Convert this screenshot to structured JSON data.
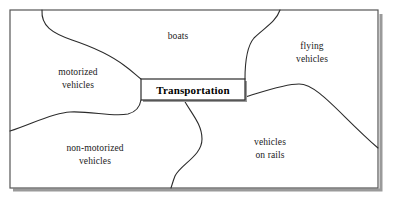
{
  "diagram": {
    "type": "concept-map",
    "center": {
      "label": "Transportation"
    },
    "regions": [
      {
        "id": "motorized-vehicles",
        "label": "motorized\nvehicles",
        "x": 78,
        "y": 78
      },
      {
        "id": "boats",
        "label": "boats",
        "x": 178,
        "y": 36
      },
      {
        "id": "flying-vehicles",
        "label": "flying\nvehicles",
        "x": 312,
        "y": 52
      },
      {
        "id": "non-motorized-vehicles",
        "label": "non-motorized\nvehicles",
        "x": 95,
        "y": 154
      },
      {
        "id": "vehicles-on-rails",
        "label": "vehicles\non rails",
        "x": 270,
        "y": 148
      }
    ],
    "colors": {
      "stroke": "#2b2b2b",
      "frame": "#555555",
      "shadow": "#9a9a9a",
      "background": "#ffffff",
      "text": "#1a1a1a"
    }
  }
}
